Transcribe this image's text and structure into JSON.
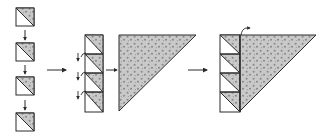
{
  "diagram": {
    "type": "tiling-assembly",
    "colors": {
      "background": "#ffffff",
      "stroke": "#2a2a2a",
      "fill": "#c9c9c9",
      "dots": "#8a8a8a"
    },
    "stages": [
      {
        "id": "column",
        "label": "",
        "pieces": 4
      },
      {
        "id": "stack-and-triangle",
        "label": "",
        "pieces": 5
      },
      {
        "id": "composite",
        "label": "",
        "pieces": 5
      }
    ],
    "arrows": [
      {
        "id": "arrow-1",
        "direction": "right"
      },
      {
        "id": "arrow-2",
        "direction": "right"
      },
      {
        "id": "arrow-3",
        "direction": "right"
      }
    ]
  }
}
